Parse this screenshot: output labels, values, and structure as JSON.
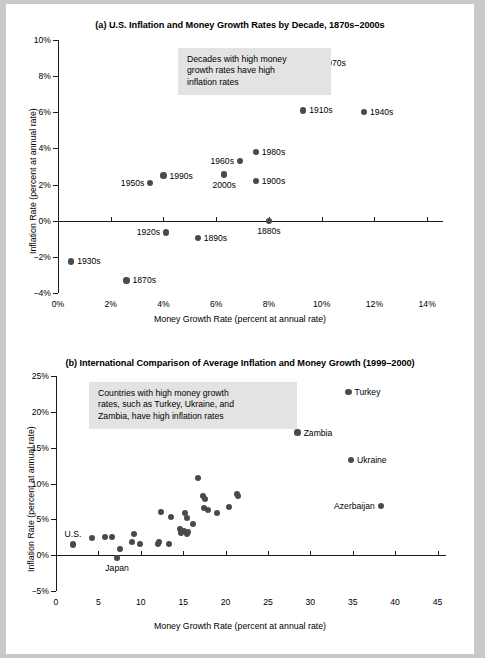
{
  "figure": {
    "background_color": "#ffffff",
    "page_color": "#c9c9c9",
    "dot_color": "#4a4a4a",
    "note_background": "#e3e3e3"
  },
  "chart_data": [
    {
      "type": "scatter",
      "panel": "a",
      "title": "(a) U.S. Inflation and Money Growth Rates by Decade, 1870s–2000s",
      "xlabel": "Money Growth Rate (percent at annual rate)",
      "ylabel": "Inflation Rate (percent at annual rate)",
      "xlim": [
        0,
        14.6
      ],
      "ylim": [
        -4,
        10
      ],
      "xticks": [
        0,
        2,
        4,
        6,
        8,
        10,
        12,
        14
      ],
      "xticklabels": [
        "0%",
        "2%",
        "4%",
        "6%",
        "8%",
        "10%",
        "12%",
        "14%"
      ],
      "yticks": [
        -4,
        -2,
        0,
        2,
        4,
        6,
        8,
        10
      ],
      "yticklabels": [
        "−4%",
        "−2%",
        "0%",
        "2%",
        "4%",
        "6%",
        "8%",
        "10%"
      ],
      "grid": false,
      "legend": "none",
      "annotation": "Decades with high money\ngrowth rates have high\ninflation rates",
      "points": [
        {
          "label": "1970s",
          "x": 9.8,
          "y": 8.7,
          "label_pos": "right"
        },
        {
          "label": "1910s",
          "x": 9.3,
          "y": 6.1,
          "label_pos": "right"
        },
        {
          "label": "1940s",
          "x": 11.6,
          "y": 6.0,
          "label_pos": "right"
        },
        {
          "label": "1980s",
          "x": 7.5,
          "y": 3.8,
          "label_pos": "right"
        },
        {
          "label": "1960s",
          "x": 6.9,
          "y": 3.3,
          "label_pos": "left"
        },
        {
          "label": "2000s",
          "x": 6.3,
          "y": 2.55,
          "label_pos": "below"
        },
        {
          "label": "1990s",
          "x": 4.0,
          "y": 2.5,
          "label_pos": "right"
        },
        {
          "label": "1950s",
          "x": 3.5,
          "y": 2.1,
          "label_pos": "left"
        },
        {
          "label": "1900s",
          "x": 7.5,
          "y": 2.2,
          "label_pos": "right"
        },
        {
          "label": "1880s",
          "x": 8.0,
          "y": 0.0,
          "label_pos": "below"
        },
        {
          "label": "1920s",
          "x": 4.1,
          "y": -0.65,
          "label_pos": "left"
        },
        {
          "label": "1890s",
          "x": 5.3,
          "y": -0.95,
          "label_pos": "right"
        },
        {
          "label": "1930s",
          "x": 0.5,
          "y": -2.25,
          "label_pos": "right"
        },
        {
          "label": "1870s",
          "x": 2.6,
          "y": -3.3,
          "label_pos": "right"
        }
      ]
    },
    {
      "type": "scatter",
      "panel": "b",
      "title": "(b) International Comparison of Average Inflation and Money Growth (1999–2000)",
      "xlabel": "Money Growth Rate (percent at annual rate)",
      "ylabel": "Inflation Rate (percent at annual rate)",
      "xlim": [
        0,
        46
      ],
      "ylim": [
        -5,
        25
      ],
      "xticks": [
        0,
        5,
        10,
        15,
        20,
        25,
        30,
        35,
        40,
        45
      ],
      "xticklabels": [
        "0",
        "5",
        "10",
        "15",
        "20",
        "25",
        "30",
        "35",
        "40",
        "45"
      ],
      "yticks": [
        -5,
        0,
        5,
        10,
        15,
        20,
        25
      ],
      "yticklabels": [
        "−5%",
        "0%",
        "5%",
        "10%",
        "15%",
        "20%",
        "25%"
      ],
      "grid": false,
      "legend": "none",
      "annotation": "Countries with high money growth\nrates, such as Turkey, Ukraine, and\nZambia, have high inflation rates",
      "labeled_points": [
        {
          "label": "Turkey",
          "x": 34.5,
          "y": 22.8,
          "label_pos": "right"
        },
        {
          "label": "Zambia",
          "x": 28.5,
          "y": 17.1,
          "label_pos": "right"
        },
        {
          "label": "Ukraine",
          "x": 34.8,
          "y": 13.3,
          "label_pos": "right"
        },
        {
          "label": "Azerbaijan",
          "x": 38.3,
          "y": 6.9,
          "label_pos": "left"
        },
        {
          "label": "U.S.",
          "x": 2.0,
          "y": 1.5,
          "label_pos": "above"
        },
        {
          "label": "Japan",
          "x": 7.2,
          "y": -0.4,
          "label_pos": "below"
        }
      ],
      "unlabeled_points": [
        {
          "x": 4.3,
          "y": 2.4
        },
        {
          "x": 5.8,
          "y": 2.5
        },
        {
          "x": 6.6,
          "y": 2.5
        },
        {
          "x": 7.6,
          "y": 0.9
        },
        {
          "x": 9.0,
          "y": 1.8
        },
        {
          "x": 9.2,
          "y": 3.0
        },
        {
          "x": 9.9,
          "y": 1.6
        },
        {
          "x": 12.0,
          "y": 1.5
        },
        {
          "x": 12.1,
          "y": 1.9
        },
        {
          "x": 12.4,
          "y": 6.0
        },
        {
          "x": 13.3,
          "y": 1.6
        },
        {
          "x": 13.6,
          "y": 5.3
        },
        {
          "x": 14.6,
          "y": 3.6
        },
        {
          "x": 14.8,
          "y": 3.1
        },
        {
          "x": 15.1,
          "y": 3.4
        },
        {
          "x": 15.4,
          "y": 2.9
        },
        {
          "x": 15.6,
          "y": 3.2
        },
        {
          "x": 15.2,
          "y": 5.9
        },
        {
          "x": 15.5,
          "y": 5.2
        },
        {
          "x": 16.1,
          "y": 4.4
        },
        {
          "x": 16.8,
          "y": 10.7
        },
        {
          "x": 17.3,
          "y": 8.2
        },
        {
          "x": 17.6,
          "y": 7.8
        },
        {
          "x": 17.5,
          "y": 6.6
        },
        {
          "x": 17.9,
          "y": 6.3
        },
        {
          "x": 19.0,
          "y": 5.9
        },
        {
          "x": 20.4,
          "y": 6.7
        },
        {
          "x": 21.4,
          "y": 8.5
        },
        {
          "x": 21.5,
          "y": 8.2
        }
      ]
    }
  ]
}
